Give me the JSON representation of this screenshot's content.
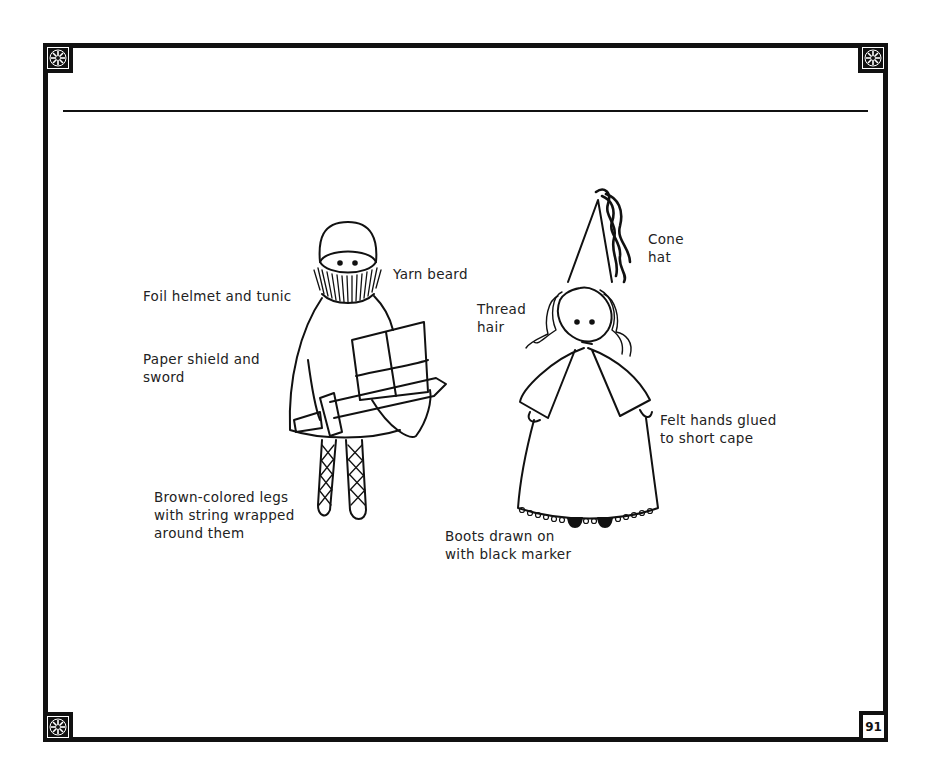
{
  "page": {
    "number": "91",
    "border_color": "#111111",
    "background": "#ffffff"
  },
  "corners": [
    {
      "position": "top-left",
      "icon": "ornament-icon"
    },
    {
      "position": "top-right",
      "icon": "ornament-icon"
    },
    {
      "position": "bottom-left",
      "icon": "ornament-icon"
    }
  ],
  "figures": {
    "knight": {
      "labels": {
        "yarn_beard": "Yarn beard",
        "helmet": "Foil helmet and tunic",
        "shield_1": "Paper shield and",
        "shield_2": "sword",
        "legs_1": "Brown-colored legs",
        "legs_2": "with string wrapped",
        "legs_3": "around them"
      }
    },
    "lady": {
      "labels": {
        "hat_1": "Cone",
        "hat_2": "hat",
        "hair_1": "Thread",
        "hair_2": "hair",
        "hands_1": "Felt hands glued",
        "hands_2": "to short cape",
        "boots_1": "Boots drawn on",
        "boots_2": "with black marker"
      }
    }
  }
}
